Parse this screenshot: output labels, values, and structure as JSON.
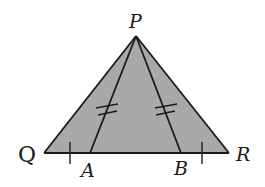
{
  "diagram": {
    "type": "geometry",
    "colors": {
      "fill": "#a9a9a9",
      "stroke": "#1a1a1a",
      "background": "#ffffff"
    },
    "points": {
      "P": {
        "label": "P",
        "x": 136,
        "y": 36
      },
      "Q": {
        "label": "Q",
        "x": 44,
        "y": 153
      },
      "R": {
        "label": "R",
        "x": 229,
        "y": 153
      },
      "A": {
        "label": "A",
        "x": 90,
        "y": 153
      },
      "B": {
        "label": "B",
        "x": 181,
        "y": 153
      }
    },
    "segments": [
      {
        "from": "P",
        "to": "Q"
      },
      {
        "from": "P",
        "to": "R"
      },
      {
        "from": "Q",
        "to": "R"
      },
      {
        "from": "P",
        "to": "A"
      },
      {
        "from": "P",
        "to": "B"
      }
    ],
    "congruence_marks": [
      {
        "segments": [
          "PA",
          "PB"
        ],
        "ticks": 2
      },
      {
        "segments": [
          "QA",
          "BR"
        ],
        "ticks": 1
      }
    ],
    "labels": {
      "P": "P",
      "Q": "Q",
      "R": "R",
      "A": "A",
      "B": "B"
    }
  }
}
